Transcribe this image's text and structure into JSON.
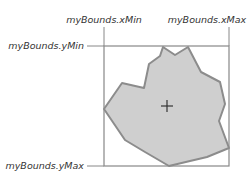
{
  "labels": {
    "xMin": "myBounds.xMin",
    "xMax": "myBounds.xMax",
    "yMin": "myBounds.yMin",
    "yMax": "myBounds.yMax"
  },
  "colors": {
    "box_stroke": "#888888",
    "shape_fill": "#cfcfcf",
    "shape_stroke": "#8c8c8c",
    "crosshair": "#333333",
    "text": "#333333"
  },
  "geometry": {
    "box": {
      "x": 104,
      "y": 46,
      "w": 125,
      "h": 120
    },
    "crosshair": {
      "x": 167,
      "y": 106,
      "size": 6
    }
  }
}
